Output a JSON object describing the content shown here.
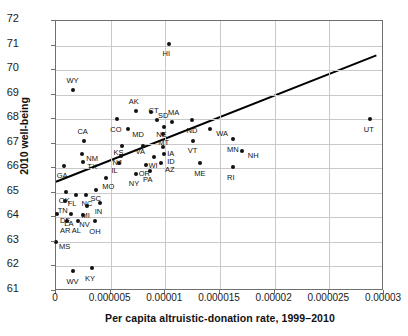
{
  "chart_data": {
    "type": "scatter",
    "title": "",
    "xlabel": "Per capita altruistic-donation rate, 1999–2010",
    "ylabel": "2010 well-being",
    "xlim": [
      0,
      3e-05
    ],
    "ylim": [
      61,
      72
    ],
    "xticks": [
      0,
      5e-06,
      1e-05,
      1.5e-05,
      2e-05,
      2.5e-05,
      3e-05
    ],
    "xticklabels": [
      "0",
      "0.000005",
      "0.00001",
      "0.000015",
      "0.00002",
      "0.000025",
      "0.00003"
    ],
    "yticks": [
      61,
      62,
      63,
      64,
      65,
      66,
      67,
      68,
      69,
      70,
      71,
      72
    ],
    "yticklabels": [
      "61",
      "62",
      "63",
      "64",
      "65",
      "66",
      "67",
      "68",
      "69",
      "70",
      "71",
      "72"
    ],
    "grid": true,
    "legend": false,
    "point_color": "#111111",
    "line_color": "#000000",
    "trendline": {
      "x0": 0,
      "y0": 65.45,
      "x1": 2.93e-05,
      "y1": 70.6,
      "label": "linear fit"
    },
    "points": [
      {
        "label": "HI",
        "x": 1.03e-05,
        "y": 71.05,
        "lx": 0,
        "ly": 6
      },
      {
        "label": "WY",
        "x": 1.6e-06,
        "y": 69.2,
        "lx": -1,
        "ly": -6
      },
      {
        "label": "AK",
        "x": 7.3e-06,
        "y": 68.35,
        "lx": -1,
        "ly": -6
      },
      {
        "label": "SD",
        "x": 8.7e-06,
        "y": 68.3,
        "lx": 7,
        "ly": 0
      },
      {
        "label": "MA",
        "x": 1.06e-05,
        "y": 67.9,
        "lx": 2,
        "ly": -6
      },
      {
        "label": "CT",
        "x": 9.2e-06,
        "y": 67.95,
        "lx": -2,
        "ly": -6
      },
      {
        "label": "CO",
        "x": 5.6e-06,
        "y": 68.0,
        "lx": -1,
        "ly": 7
      },
      {
        "label": "ND",
        "x": 1.24e-05,
        "y": 67.95,
        "lx": 1,
        "ly": 7
      },
      {
        "label": "WA",
        "x": 1.41e-05,
        "y": 67.6,
        "lx": 6,
        "ly": 1
      },
      {
        "label": "MD",
        "x": 6.6e-06,
        "y": 67.6,
        "lx": 4,
        "ly": 2
      },
      {
        "label": "NE",
        "x": 9.9e-06,
        "y": 67.7,
        "lx": -2,
        "ly": 4
      },
      {
        "label": "MT",
        "x": 9.8e-06,
        "y": 67.4,
        "lx": 1,
        "ly": 5
      },
      {
        "label": "CA",
        "x": 2.6e-06,
        "y": 67.1,
        "lx": -1,
        "ly": -6
      },
      {
        "label": "VT",
        "x": 1.25e-05,
        "y": 67.1,
        "lx": 1,
        "ly": 6
      },
      {
        "label": "MN",
        "x": 1.62e-05,
        "y": 67.2,
        "lx": 0,
        "ly": 7
      },
      {
        "label": "UT",
        "x": 2.87e-05,
        "y": 68.0,
        "lx": 0,
        "ly": 7
      },
      {
        "label": "NH",
        "x": 1.7e-05,
        "y": 66.7,
        "lx": 6,
        "ly": 1
      },
      {
        "label": "KS",
        "x": 6e-06,
        "y": 66.9,
        "lx": -2,
        "ly": 3
      },
      {
        "label": "VA",
        "x": 8e-06,
        "y": 66.9,
        "lx": -2,
        "ly": 2
      },
      {
        "label": "IA",
        "x": 9.8e-06,
        "y": 66.85,
        "lx": 4,
        "ly": 3
      },
      {
        "label": "NM",
        "x": 2.4e-06,
        "y": 66.6,
        "lx": 4,
        "ly": 1
      },
      {
        "label": "NJ",
        "x": 5.9e-06,
        "y": 66.5,
        "lx": -2,
        "ly": 3
      },
      {
        "label": "ID",
        "x": 9.9e-06,
        "y": 66.6,
        "lx": 3,
        "ly": 4
      },
      {
        "label": "WI",
        "x": 9e-06,
        "y": 66.45,
        "lx": 0,
        "ly": 5
      },
      {
        "label": "TX",
        "x": 2.5e-06,
        "y": 66.25,
        "lx": 4,
        "ly": 1
      },
      {
        "label": "IL",
        "x": 5.8e-06,
        "y": 66.2,
        "lx": -2,
        "ly": 4
      },
      {
        "label": "OR",
        "x": 8.2e-06,
        "y": 66.15,
        "lx": -1,
        "ly": 5
      },
      {
        "label": "AZ",
        "x": 9.6e-06,
        "y": 66.2,
        "lx": 4,
        "ly": 3
      },
      {
        "label": "ME",
        "x": 1.32e-05,
        "y": 66.2,
        "lx": 0,
        "ly": 7
      },
      {
        "label": "GA",
        "x": 7e-07,
        "y": 66.1,
        "lx": -1,
        "ly": 6
      },
      {
        "label": "PA",
        "x": 8.6e-06,
        "y": 65.9,
        "lx": -1,
        "ly": 5
      },
      {
        "label": "NY",
        "x": 7.3e-06,
        "y": 65.75,
        "lx": -1,
        "ly": 6
      },
      {
        "label": "RI",
        "x": 1.62e-05,
        "y": 66.05,
        "lx": 0,
        "ly": 7
      },
      {
        "label": "MO",
        "x": 4.6e-06,
        "y": 65.6,
        "lx": 2,
        "ly": 5
      },
      {
        "label": "OK",
        "x": 9e-07,
        "y": 65.05,
        "lx": -1,
        "ly": 5
      },
      {
        "label": "SC",
        "x": 3.7e-06,
        "y": 65.1,
        "lx": 0,
        "ly": 5
      },
      {
        "label": "FL",
        "x": 1.8e-06,
        "y": 64.9,
        "lx": -2,
        "ly": 5
      },
      {
        "label": "NC",
        "x": 2.7e-06,
        "y": 64.9,
        "lx": 2,
        "ly": 5
      },
      {
        "label": "TN",
        "x": 8e-07,
        "y": 64.65,
        "lx": -1,
        "ly": 6
      },
      {
        "label": "MI",
        "x": 2.8e-06,
        "y": 64.45,
        "lx": 1,
        "ly": 6
      },
      {
        "label": "IN",
        "x": 4e-06,
        "y": 64.6,
        "lx": 1,
        "ly": 5
      },
      {
        "label": "DE",
        "x": 1e-07,
        "y": 64.15,
        "lx": 3,
        "ly": 3
      },
      {
        "label": "LA",
        "x": 1.4e-06,
        "y": 64.15,
        "lx": -1,
        "ly": 6
      },
      {
        "label": "NV",
        "x": 2.5e-06,
        "y": 64.1,
        "lx": 2,
        "ly": 6
      },
      {
        "label": "AR",
        "x": 1e-06,
        "y": 63.85,
        "lx": -1,
        "ly": 6
      },
      {
        "label": "AL",
        "x": 2e-06,
        "y": 63.85,
        "lx": 0,
        "ly": 6
      },
      {
        "label": "OH",
        "x": 3.6e-06,
        "y": 63.85,
        "lx": 0,
        "ly": 7
      },
      {
        "label": "MS",
        "x": 0.0,
        "y": 63.0,
        "lx": 3,
        "ly": 1
      },
      {
        "label": "WV",
        "x": 1.6e-06,
        "y": 61.8,
        "lx": -1,
        "ly": 7
      },
      {
        "label": "KY",
        "x": 3.3e-06,
        "y": 61.95,
        "lx": -1,
        "ly": 7
      }
    ]
  }
}
